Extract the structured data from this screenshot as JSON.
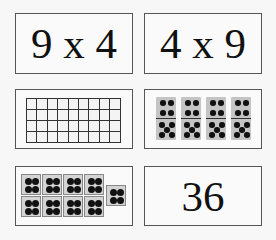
{
  "cards": [
    {
      "id": "expr-9x4",
      "text": "9 x 4"
    },
    {
      "id": "expr-4x9",
      "text": "4 x 9"
    },
    {
      "id": "array-grid",
      "rows": 4,
      "cols": 9
    },
    {
      "id": "dominoes",
      "count": 4,
      "top_pips": 4,
      "bottom_pips": 5
    },
    {
      "id": "dot-groups",
      "groups": 9,
      "dots_per_group": 4
    },
    {
      "id": "product",
      "text": "36"
    }
  ],
  "colors": {
    "border": "#555555",
    "card_bg": "#fafafa",
    "domino_fill": "#c4c4c4",
    "dot": "#111111"
  }
}
